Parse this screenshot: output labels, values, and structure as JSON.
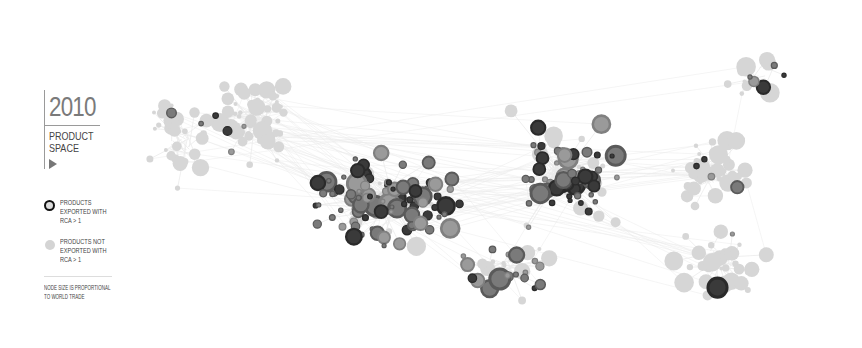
{
  "header": {
    "year": "2010",
    "title_lines": [
      "PRODUCT",
      "SPACE"
    ],
    "play_icon": "play-triangle-icon"
  },
  "legend": {
    "items": [
      {
        "label_lines": [
          "PRODUCTS",
          "EXPORTED WITH",
          "RCA > 1"
        ],
        "style": "dark-ring"
      },
      {
        "label_lines": [
          "PRODUCTS NOT",
          "EXPORTED WITH",
          "RCA > 1"
        ],
        "style": "light-grey"
      }
    ],
    "note_lines": [
      "NODE SIZE IS PROPORTIONAL",
      "TO WORLD TRADE"
    ]
  },
  "colors": {
    "background": "#ffffff",
    "edge": "#ebebeb",
    "not_exported_fill": "#d6d6d6",
    "exported_dark": "#2a2a2a",
    "exported_mid": "#5a5a5a",
    "exported_light": "#808080"
  },
  "network": {
    "seed": 2010,
    "description": "Product space network graph; dark nodes = exported with RCA>1, light nodes = not exported",
    "clusters": [
      {
        "cx": 255,
        "cy": 120,
        "rx": 70,
        "ry": 55,
        "exported_ratio": 0.15,
        "count": 55
      },
      {
        "cx": 390,
        "cy": 200,
        "rx": 110,
        "ry": 60,
        "exported_ratio": 0.85,
        "count": 120
      },
      {
        "cx": 560,
        "cy": 170,
        "rx": 80,
        "ry": 70,
        "exported_ratio": 0.75,
        "count": 80
      },
      {
        "cx": 710,
        "cy": 175,
        "rx": 60,
        "ry": 45,
        "exported_ratio": 0.05,
        "count": 45
      },
      {
        "cx": 720,
        "cy": 260,
        "rx": 60,
        "ry": 50,
        "exported_ratio": 0.08,
        "count": 35
      },
      {
        "cx": 180,
        "cy": 140,
        "rx": 45,
        "ry": 70,
        "exported_ratio": 0.12,
        "count": 30
      },
      {
        "cx": 760,
        "cy": 75,
        "rx": 55,
        "ry": 30,
        "exported_ratio": 0.6,
        "count": 14
      },
      {
        "cx": 500,
        "cy": 270,
        "rx": 70,
        "ry": 35,
        "exported_ratio": 0.6,
        "count": 30
      }
    ]
  }
}
